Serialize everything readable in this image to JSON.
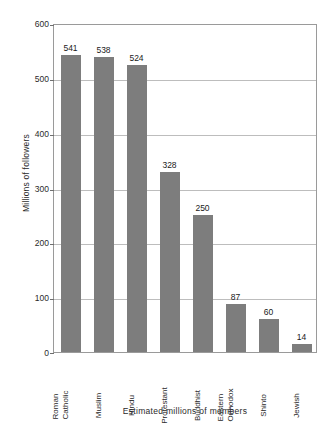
{
  "chart_data": {
    "type": "bar",
    "title": "",
    "xlabel": "Estimated millions of members",
    "ylabel": "Millions of followers",
    "categories": [
      "Roman Catholic",
      "Muslim",
      "Hindu",
      "Protestant",
      "Buddhist",
      "Eastern Orthodox",
      "Shinto",
      "Jewish"
    ],
    "category_lines": [
      [
        "Roman",
        "Catholic"
      ],
      [
        "Muslim",
        ""
      ],
      [
        "Hindu",
        ""
      ],
      [
        "Protestant",
        ""
      ],
      [
        "Buddhist",
        ""
      ],
      [
        "Eastern",
        "Orthodox"
      ],
      [
        "Shinto",
        ""
      ],
      [
        "Jewish",
        ""
      ]
    ],
    "values": [
      541,
      538,
      524,
      328,
      250,
      87,
      60,
      14
    ],
    "value_labels": [
      "541",
      "538",
      "524",
      "328",
      "250",
      "87",
      "60",
      "14"
    ],
    "ylim": [
      0,
      600
    ],
    "yticks": [
      0,
      100,
      200,
      300,
      400,
      500,
      600
    ],
    "ytick_labels": [
      "0",
      "100",
      "200",
      "300",
      "400",
      "500",
      "600"
    ],
    "grid": true,
    "legend": false,
    "bar_color": "#7d7d7d",
    "grid_color": "#bdbdbd",
    "axis_color": "#9a9a9a"
  }
}
